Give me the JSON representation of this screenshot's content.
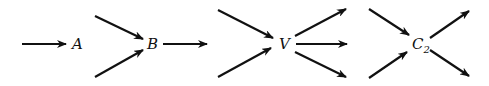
{
  "diagram": {
    "nodes": [
      {
        "id": "A",
        "label": "A",
        "subscript": "",
        "incoming": 1,
        "outgoing": 0
      },
      {
        "id": "B",
        "label": "B",
        "subscript": "",
        "incoming": 2,
        "outgoing": 1
      },
      {
        "id": "V",
        "label": "V",
        "subscript": "",
        "incoming": 2,
        "outgoing": 3
      },
      {
        "id": "C2",
        "label": "C",
        "subscript": "2",
        "incoming": 2,
        "outgoing": 2
      }
    ],
    "color": "#111111"
  }
}
